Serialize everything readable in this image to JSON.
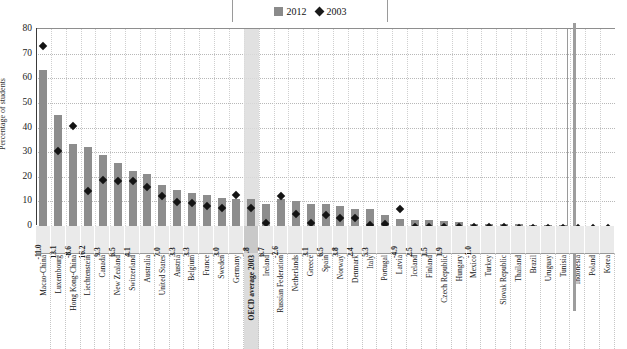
{
  "legend": {
    "items": [
      {
        "label": "2012",
        "marker": "square-swatch",
        "color": "#8a8a8a"
      },
      {
        "label": "2003",
        "marker": "diamond-marker",
        "color": "#1a1a1a"
      }
    ]
  },
  "axis": {
    "ylabel": "Percentage of students",
    "yticks": [
      "0",
      "10",
      "20",
      "30",
      "40",
      "50",
      "60",
      "70",
      "80"
    ]
  },
  "chart_data": {
    "type": "bar",
    "title": "",
    "subtitle": "",
    "xlabel": "",
    "ylabel": "Percentage of students",
    "ylim": [
      0,
      80
    ],
    "ytick_step": 10,
    "grid": true,
    "legend_position": "top-center",
    "highlight_category": "OECD average 2003",
    "separator_after": "Tunisia",
    "categories": [
      "Macao-China",
      "Luxembourg",
      "Hong Kong-China",
      "Liechtenstein",
      "Canada",
      "New Zealand",
      "Switzerland",
      "Australia",
      "United States",
      "Austria",
      "Belgium",
      "France",
      "Sweden",
      "Germany",
      "OECD average 2003",
      "Ireland",
      "Russian Federation",
      "Netherlands",
      "Greece",
      "Spain",
      "Norway",
      "Denmark",
      "Italy",
      "Portugal",
      "Latvia",
      "Iceland",
      "Finland",
      "Czech Republic",
      "Hungary",
      "Mexico",
      "Turkey",
      "Slovak Republic",
      "Thailand",
      "Brazil",
      "Uruguay",
      "Tunisia",
      "Indonesia",
      "Poland",
      "Korea"
    ],
    "series": [
      {
        "name": "2012",
        "marker": "bar",
        "color": "#8d8d8d",
        "values": [
          63.5,
          45.0,
          33.5,
          32.0,
          29.0,
          25.5,
          22.5,
          21.0,
          16.5,
          14.5,
          13.5,
          12.5,
          11.5,
          11.0,
          11.0,
          9.0,
          11.0,
          10.0,
          9.0,
          9.0,
          8.0,
          7.0,
          7.0,
          4.5,
          3.0,
          2.5,
          2.5,
          2.0,
          1.5,
          1.0,
          1.0,
          1.0,
          0.8,
          0.5,
          0.5,
          0.5,
          null,
          null,
          null
        ]
      },
      {
        "name": "2003",
        "marker": "diamond",
        "color": "#141414",
        "values": [
          74.5,
          31.5,
          42.0,
          15.5,
          20.0,
          19.5,
          19.5,
          17.0,
          13.5,
          11.0,
          10.5,
          9.5,
          8.5,
          14.0,
          8.5,
          2.5,
          13.5,
          6.0,
          2.5,
          5.5,
          4.5,
          4.5,
          1.5,
          2.0,
          8.0,
          1.0,
          1.0,
          1.0,
          1.0,
          0.8,
          0.8,
          0.8,
          0.5,
          0.5,
          0.5,
          0.5,
          0.5,
          0.5,
          0.5
        ]
      }
    ],
    "difference_labels": {
      "series_name": "Change 2003-2012",
      "values": [
        "-11.0",
        "13.1",
        "-8.6",
        "16.2",
        "9.3",
        "6.5",
        "4.1",
        "",
        "7.0",
        "3.3",
        "3.3",
        "",
        "3.0",
        "",
        "2.8",
        "6.7",
        "-2.6",
        "",
        "3.1",
        "6.5",
        "3.8",
        "2.4",
        "5.3",
        "",
        "-4.9",
        "2.5",
        "1.5",
        "1.9",
        "",
        "-1.0",
        "",
        "",
        "",
        "",
        "",
        "",
        "",
        "",
        ""
      ]
    }
  }
}
